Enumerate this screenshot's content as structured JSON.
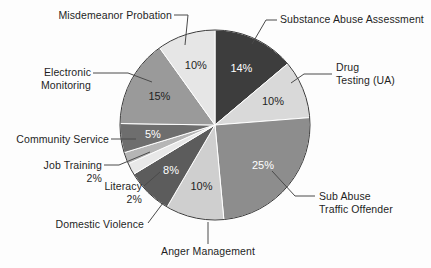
{
  "figure": {
    "background_color": "#fdfdfd",
    "text_color": "#1f1f1f",
    "leader_color": "#4a4a4a"
  },
  "chart_data": {
    "type": "pie",
    "title": "",
    "subtitle": "",
    "xlabel": "",
    "ylabel": "",
    "legend_position": "callout-labels",
    "grid": false,
    "start_angle_deg": 0,
    "direction": "clockwise",
    "units": "percent",
    "categories": [
      "Substance Abuse Assessment",
      "Drug Testing (UA)",
      "Sub Abuse Traffic Offender",
      "Anger Management",
      "Domestic Violence",
      "Literacy",
      "Job Training",
      "Community Service",
      "Electronic Monitoring",
      "Misdemeanor Probation"
    ],
    "values": [
      14,
      10,
      25,
      10,
      8,
      2,
      2,
      5,
      15,
      10
    ],
    "value_labels": [
      "14%",
      "10%",
      "25%",
      "10%",
      "8%",
      "2%",
      "2%",
      "5%",
      "15%",
      "10%"
    ],
    "colors": [
      "#3d3d3d",
      "#d9d9d9",
      "#8d8d8d",
      "#cfcfcf",
      "#5c5c5c",
      "#e8e8e8",
      "#b5b5b5",
      "#6e6e6e",
      "#9a9a9a",
      "#e6e6e6"
    ],
    "slice_label_colors": [
      "#ffffff",
      "#1f1f1f",
      "#ffffff",
      "#1f1f1f",
      "#ffffff",
      "",
      "",
      "#ffffff",
      "#1f1f1f",
      "#1f1f1f"
    ]
  },
  "slices": {
    "substance_abuse_assessment": {
      "name": "Substance Abuse Assessment",
      "value_label": "14%",
      "callout": "Substance Abuse Assessment"
    },
    "drug_testing": {
      "name": "Drug Testing (UA)",
      "value_label": "10%",
      "callout_line1": "Drug",
      "callout_line2": "Testing (UA)"
    },
    "sub_abuse_traffic_offender": {
      "name": "Sub Abuse Traffic Offender",
      "value_label": "25%",
      "callout_line1": "Sub Abuse",
      "callout_line2": "Traffic Offender"
    },
    "anger_management": {
      "name": "Anger Management",
      "value_label": "10%",
      "callout": "Anger Management"
    },
    "domestic_violence": {
      "name": "Domestic Violence",
      "value_label": "8%",
      "callout": "Domestic Violence"
    },
    "literacy": {
      "name": "Literacy",
      "value_label": "2%",
      "callout": "Literacy"
    },
    "job_training": {
      "name": "Job Training",
      "value_label": "2%",
      "callout": "Job Training"
    },
    "community_service": {
      "name": "Community Service",
      "value_label": "5%",
      "callout": "Community Service"
    },
    "electronic_monitoring": {
      "name": "Electronic Monitoring",
      "value_label": "15%",
      "callout_line1": "Electronic",
      "callout_line2": "Monitoring"
    },
    "misdemeanor_probation": {
      "name": "Misdemeanor Probation",
      "value_label": "10%",
      "callout": "Misdemeanor Probation"
    }
  }
}
